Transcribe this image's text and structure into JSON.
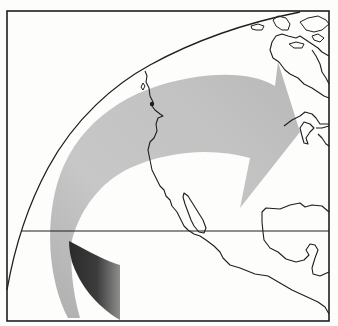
{
  "figure": {
    "width": 338,
    "height": 326
  },
  "colors": {
    "background": "#fdfdfc",
    "line": "#1e1e1e",
    "arrow_dark": "#2a2a2a",
    "arrow_mid": "#9a9a9a",
    "arrow_light": "#c4c4c4",
    "arrow_head": "#b4b4b4"
  },
  "elements": {
    "frame": {
      "x": 7,
      "y": 11,
      "width": 322,
      "height": 310
    },
    "horizon_arc": {
      "label": ""
    },
    "latitude_line": {
      "y": 231,
      "label": ""
    },
    "arrow": {
      "direction": "south-west to north-east",
      "label": ""
    },
    "landmasses": [
      "North America west coast",
      "Baja California",
      "Mexico",
      "Gulf of Mexico coast",
      "Great Lakes",
      "Hudson Bay",
      "Canadian Arctic islands"
    ]
  }
}
